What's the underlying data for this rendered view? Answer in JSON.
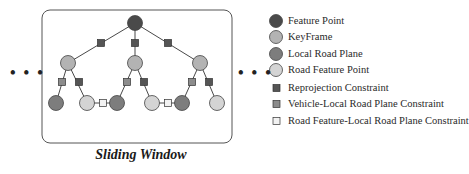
{
  "diagram": {
    "caption": "Sliding Window",
    "ellipsis_left": "• • •",
    "ellipsis_right": "• • •",
    "colors": {
      "feature_point": "#4a4a4a",
      "keyframe": "#b3b3b3",
      "local_road_plane": "#7d7d7d",
      "road_feature_point": "#d4d4d4",
      "reprojection_constraint": "#555555",
      "vehicle_plane_constraint": "#8c8c8c",
      "road_feature_plane_constraint": "#f2f2f2",
      "edge": "#333333",
      "window_border": "#555555"
    },
    "nodes": {
      "feature_points": [
        {
          "x": 135,
          "y": 23
        }
      ],
      "keyframes": [
        {
          "x": 68,
          "y": 63
        },
        {
          "x": 135,
          "y": 63
        },
        {
          "x": 200,
          "y": 63
        }
      ],
      "local_road_planes": [
        {
          "x": 56,
          "y": 103
        },
        {
          "x": 117,
          "y": 103
        },
        {
          "x": 182,
          "y": 103
        }
      ],
      "road_feature_points": [
        {
          "x": 87,
          "y": 103
        },
        {
          "x": 152,
          "y": 103
        },
        {
          "x": 217,
          "y": 103
        }
      ]
    },
    "constraints": {
      "reprojection": [
        {
          "x": 101,
          "y": 43
        },
        {
          "x": 135,
          "y": 43
        },
        {
          "x": 168,
          "y": 43
        },
        {
          "x": 79,
          "y": 82
        },
        {
          "x": 144,
          "y": 82
        },
        {
          "x": 209,
          "y": 82
        }
      ],
      "vehicle_local_road_plane": [
        {
          "x": 62,
          "y": 82
        },
        {
          "x": 127,
          "y": 82
        },
        {
          "x": 192,
          "y": 82
        }
      ],
      "road_feature_local_road_plane": [
        {
          "x": 103,
          "y": 103
        },
        {
          "x": 168,
          "y": 103
        }
      ]
    }
  },
  "legend": {
    "items": [
      {
        "label": "Feature Point",
        "shape": "circle",
        "color": "#4a4a4a"
      },
      {
        "label": "KeyFrame",
        "shape": "circle",
        "color": "#b3b3b3"
      },
      {
        "label": "Local Road Plane",
        "shape": "circle",
        "color": "#7d7d7d"
      },
      {
        "label": "Road Feature Point",
        "shape": "circle",
        "color": "#d4d4d4"
      },
      {
        "label": "Reprojection Constraint",
        "shape": "square",
        "color": "#555555"
      },
      {
        "label": "Vehicle-Local Road Plane  Constraint",
        "shape": "square",
        "color": "#8c8c8c"
      },
      {
        "label": "Road Feature-Local Road Plane  Constraint",
        "shape": "square",
        "color": "#f2f2f2"
      }
    ]
  }
}
